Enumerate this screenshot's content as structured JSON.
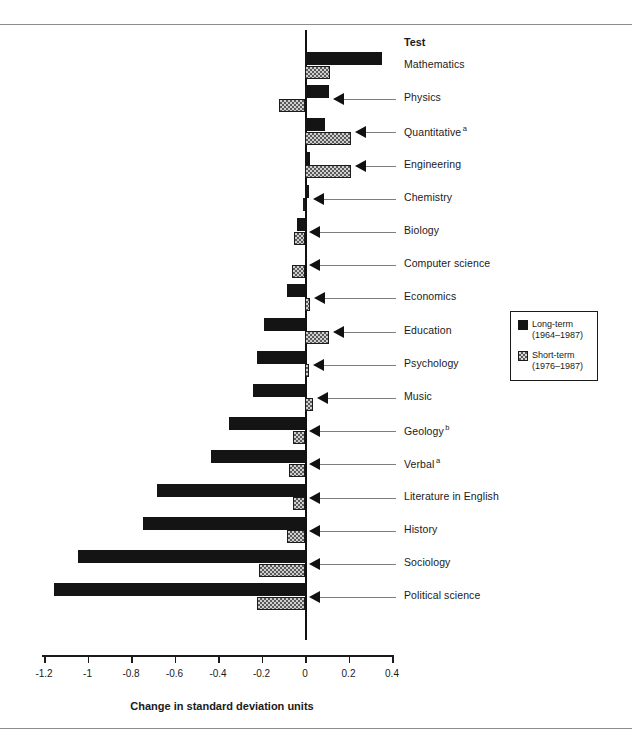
{
  "header": {
    "test_column_label": "Test"
  },
  "legend": {
    "entries": [
      {
        "name": "long-term",
        "label": "Long-term",
        "period": "(1964–1987)",
        "color": "#141414"
      },
      {
        "name": "short-term",
        "label": "Short-term",
        "period": "(1976–1987)",
        "color": "#cfcfcf"
      }
    ]
  },
  "axis": {
    "title": "Change in standard deviation units",
    "ticks": [
      "-1.2",
      "-1",
      "-0.8",
      "-0.6",
      "-0.4",
      "-0.2",
      "0",
      "0.2",
      "0.4"
    ]
  },
  "chart_data": {
    "type": "bar",
    "orientation": "horizontal",
    "title": "",
    "xlabel": "Change in standard deviation units",
    "ylabel": "Test",
    "xlim": [
      -1.2,
      0.4
    ],
    "grid": false,
    "legend_position": "right-middle",
    "categories": [
      "Mathematics",
      "Physics",
      "Quantitative",
      "Engineering",
      "Chemistry",
      "Biology",
      "Computer science",
      "Economics",
      "Education",
      "Psychology",
      "Music",
      "Geology",
      "Verbal",
      "Literature in English",
      "History",
      "Sociology",
      "Political science"
    ],
    "category_footnotes": {
      "Quantitative": "a",
      "Geology": "b",
      "Verbal": "a"
    },
    "series": [
      {
        "name": "Long-term (1964–1987)",
        "values": [
          0.355,
          0.11,
          0.09,
          0.025,
          0.02,
          -0.035,
          0.0,
          -0.085,
          -0.19,
          -0.22,
          -0.24,
          -0.35,
          -0.43,
          -0.68,
          -0.745,
          -1.045,
          -1.155
        ]
      },
      {
        "name": "Short-term (1976–1987)",
        "values": [
          0.115,
          -0.12,
          0.21,
          0.21,
          -0.01,
          -0.05,
          -0.06,
          0.025,
          0.11,
          0.02,
          0.035,
          -0.055,
          -0.075,
          -0.055,
          -0.085,
          -0.21,
          -0.22
        ]
      }
    ]
  }
}
